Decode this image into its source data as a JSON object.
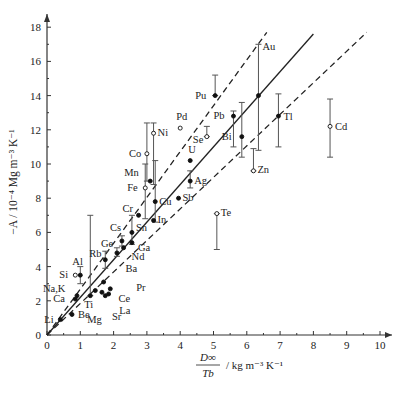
{
  "chart_data": {
    "type": "scatter",
    "title": "",
    "xlabel": "D∞ / Tb / kg m⁻³ K⁻¹",
    "xlabel_parts": {
      "num": "D∞",
      "den": "Tb",
      "unit": "/ kg m⁻³ K⁻¹"
    },
    "ylabel": "−A / 10⁻⁴ Mg m⁻³ K⁻¹",
    "xlim": [
      0,
      10.5
    ],
    "ylim": [
      0,
      18.5
    ],
    "xticks": [
      0,
      1,
      2,
      3,
      4,
      5,
      6,
      7,
      8,
      9,
      10
    ],
    "yticks": [
      0,
      2,
      4,
      6,
      8,
      10,
      12,
      14,
      16,
      18
    ],
    "grid": false,
    "lines": [
      {
        "name": "fit",
        "style": "solid",
        "x": [
          0,
          8.0
        ],
        "y": [
          0,
          17.6
        ]
      },
      {
        "name": "upper-bound",
        "style": "dashed",
        "x": [
          0,
          6.6
        ],
        "y": [
          0,
          17.7
        ]
      },
      {
        "name": "lower-bound",
        "style": "dashed",
        "x": [
          0,
          9.6
        ],
        "y": [
          0,
          17.7
        ]
      }
    ],
    "points": [
      {
        "label": "Li",
        "x": 0.4,
        "y": 0.9,
        "filled": true
      },
      {
        "label": "Be",
        "x": 0.75,
        "y": 1.2,
        "filled": true
      },
      {
        "label": "Ca",
        "x": 0.85,
        "y": 2.1,
        "filled": true
      },
      {
        "label": "Na,K",
        "x": 0.9,
        "y": 2.3,
        "filled": true
      },
      {
        "label": "Si",
        "x": 0.85,
        "y": 3.5,
        "filled": false
      },
      {
        "label": "Al",
        "x": 1.0,
        "y": 3.5,
        "filled": true,
        "err": [
          3.0,
          4.0
        ]
      },
      {
        "label": "Ti",
        "x": 1.3,
        "y": 2.3,
        "filled": true,
        "err": [
          2.3,
          7.0
        ]
      },
      {
        "label": "Mg",
        "x": 1.45,
        "y": 2.6,
        "filled": true
      },
      {
        "label": "Ba",
        "x": 1.7,
        "y": 3.1,
        "filled": true
      },
      {
        "label": "Sr",
        "x": 1.65,
        "y": 2.5,
        "filled": true
      },
      {
        "label": "La",
        "x": 1.75,
        "y": 2.3,
        "filled": true
      },
      {
        "label": "Ce",
        "x": 1.85,
        "y": 2.4,
        "filled": true
      },
      {
        "label": "Pr",
        "x": 1.9,
        "y": 2.7,
        "filled": true
      },
      {
        "label": "Rb",
        "x": 1.75,
        "y": 4.4,
        "filled": true,
        "err": [
          3.9,
          4.9
        ]
      },
      {
        "label": "Ge",
        "x": 2.1,
        "y": 4.8,
        "filled": true,
        "err": [
          4.6,
          5.1
        ]
      },
      {
        "label": "Nd",
        "x": 2.3,
        "y": 5.1,
        "filled": true
      },
      {
        "label": "Cs",
        "x": 2.25,
        "y": 5.5,
        "filled": true,
        "err": [
          5.2,
          5.8
        ]
      },
      {
        "label": "Ga",
        "x": 2.55,
        "y": 5.4,
        "filled": true
      },
      {
        "label": "Sn",
        "x": 2.55,
        "y": 6.0,
        "filled": true,
        "err": [
          5.3,
          7.0
        ]
      },
      {
        "label": "Cr",
        "x": 2.75,
        "y": 7.0,
        "filled": true
      },
      {
        "label": "Fe",
        "x": 2.95,
        "y": 8.6,
        "filled": false,
        "err": [
          6.8,
          10.0
        ]
      },
      {
        "label": "Mn",
        "x": 3.1,
        "y": 9.0,
        "filled": true
      },
      {
        "label": "Co",
        "x": 3.0,
        "y": 10.6,
        "filled": false,
        "err": [
          9.0,
          12.4
        ]
      },
      {
        "label": "Ni",
        "x": 3.2,
        "y": 11.8,
        "filled": false,
        "err": [
          8.8,
          12.4
        ]
      },
      {
        "label": "Cu",
        "x": 3.25,
        "y": 7.8,
        "filled": true,
        "err": [
          6.6,
          10.2
        ]
      },
      {
        "label": "In",
        "x": 3.2,
        "y": 6.7,
        "filled": true
      },
      {
        "label": "Sb",
        "x": 3.95,
        "y": 8.0,
        "filled": true
      },
      {
        "label": "Ag",
        "x": 4.3,
        "y": 9.0,
        "filled": true,
        "err": [
          8.6,
          9.6
        ]
      },
      {
        "label": "U",
        "x": 4.3,
        "y": 10.2,
        "filled": true
      },
      {
        "label": "Pd",
        "x": 4.0,
        "y": 12.1,
        "filled": false
      },
      {
        "label": "Se",
        "x": 4.8,
        "y": 11.6,
        "filled": false,
        "err": [
          11.6,
          12.2
        ]
      },
      {
        "label": "Te",
        "x": 5.1,
        "y": 7.1,
        "filled": false,
        "err": [
          5.0,
          7.1
        ]
      },
      {
        "label": "Pu",
        "x": 5.05,
        "y": 14.0,
        "filled": true,
        "err": [
          14.0,
          15.2
        ]
      },
      {
        "label": "Pb",
        "x": 5.6,
        "y": 12.8,
        "filled": true,
        "err": [
          11.0,
          13.1
        ]
      },
      {
        "label": "Bi",
        "x": 5.85,
        "y": 11.6,
        "filled": true,
        "err": [
          10.4,
          13.6
        ]
      },
      {
        "label": "Au",
        "x": 6.35,
        "y": 14.0,
        "filled": true,
        "err": [
          10.8,
          17.0
        ]
      },
      {
        "label": "Zn",
        "x": 6.2,
        "y": 9.6,
        "filled": false,
        "err": [
          9.6,
          10.9
        ]
      },
      {
        "label": "Tl",
        "x": 6.95,
        "y": 12.8,
        "filled": true,
        "err": [
          11.0,
          14.1
        ]
      },
      {
        "label": "Cd",
        "x": 8.5,
        "y": 12.2,
        "filled": false,
        "err": [
          10.4,
          13.8
        ]
      }
    ]
  }
}
